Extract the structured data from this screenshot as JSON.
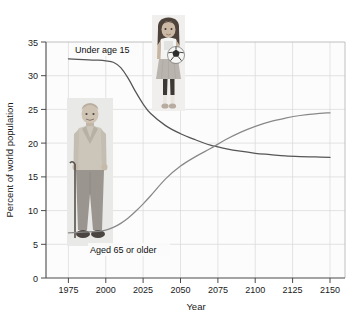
{
  "figure": {
    "watermark_text": "",
    "background_color": "#ffffff",
    "plot_background_color": "#fcfcfc",
    "axis_color": "#4a4a4a",
    "grid_color": "#d8d8d8"
  },
  "chart_data": {
    "type": "line",
    "title": "",
    "xlabel": "Year",
    "ylabel": "Percent of world population",
    "xlim": [
      1960,
      2160
    ],
    "ylim": [
      0,
      35
    ],
    "xticks": [
      1975,
      2000,
      2025,
      2050,
      2075,
      2100,
      2125,
      2150
    ],
    "xtick_labels": [
      "1975",
      "2000",
      "2025",
      "2050",
      "2075",
      "2100",
      "2125",
      "2150"
    ],
    "yticks": [
      0,
      5,
      10,
      15,
      20,
      25,
      30,
      35
    ],
    "ytick_labels": [
      "0",
      "5",
      "10",
      "15",
      "20",
      "25",
      "30",
      "35"
    ],
    "grid": true,
    "legend_position": "inline-annotations",
    "annotations": [
      {
        "name": "under-age-15-label",
        "text": "Under age 15",
        "x": 2006,
        "y": 33.6
      },
      {
        "name": "aged-65-or-older-label",
        "text": "Aged 65 or older",
        "x": 2012,
        "y": 5.1
      }
    ],
    "series": [
      {
        "name": "Under age 15",
        "color": "#555555",
        "x": [
          1975,
          1985,
          1995,
          2000,
          2005,
          2010,
          2015,
          2020,
          2025,
          2030,
          2040,
          2050,
          2060,
          2070,
          2080,
          2090,
          2100,
          2110,
          2120,
          2130,
          2140,
          2150
        ],
        "values": [
          32.5,
          32.4,
          32.3,
          32.2,
          32.0,
          31.2,
          29.6,
          27.6,
          25.8,
          24.4,
          22.6,
          21.4,
          20.5,
          19.7,
          19.2,
          18.8,
          18.5,
          18.3,
          18.1,
          18.0,
          17.95,
          17.9
        ]
      },
      {
        "name": "Aged 65 or older",
        "color": "#888888",
        "x": [
          1975,
          1985,
          1995,
          2000,
          2005,
          2010,
          2015,
          2020,
          2025,
          2030,
          2040,
          2050,
          2060,
          2070,
          2080,
          2090,
          2100,
          2110,
          2120,
          2130,
          2140,
          2150
        ],
        "values": [
          6.7,
          6.8,
          6.9,
          7.1,
          7.5,
          8.1,
          8.9,
          9.9,
          11.0,
          12.2,
          14.7,
          16.6,
          18.0,
          19.2,
          20.5,
          21.6,
          22.5,
          23.2,
          23.7,
          24.1,
          24.35,
          24.5
        ]
      }
    ],
    "crossing_point": {
      "x": 2072,
      "y": 19.2
    }
  },
  "photos": [
    {
      "name": "elderly-man-photo",
      "description": "Elderly man standing with a cane",
      "alt": "Elderly man with cane"
    },
    {
      "name": "young-girl-photo",
      "description": "Young girl holding a soccer ball",
      "alt": "Young girl with soccer ball"
    }
  ]
}
